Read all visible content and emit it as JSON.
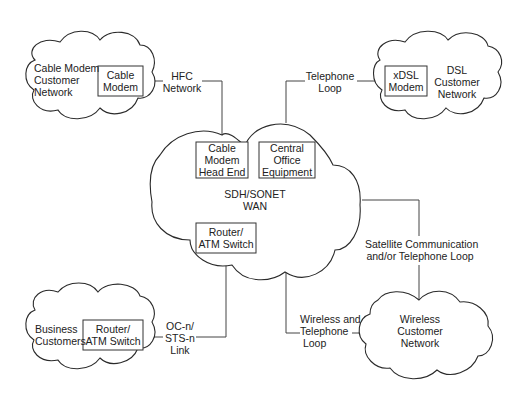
{
  "diagram": {
    "colors": {
      "stroke": "#2a2a2a",
      "text": "#222222",
      "background": "#ffffff"
    },
    "clouds": {
      "cable_modem_network": {
        "label": "Cable Modem\nCustomer\nNetwork",
        "device": "Cable\nModem"
      },
      "dsl_network": {
        "label": "DSL\nCustomer\nNetwork",
        "device": "xDSL\nModem"
      },
      "wan": {
        "label": "SDH/SONET\nWAN",
        "devices": {
          "head_end": "Cable\nModem\nHead End",
          "central_office": "Central\nOffice\nEquipment",
          "router": "Router/\nATM Switch"
        }
      },
      "business": {
        "label": "Business\nCustomers",
        "device": "Router/\nATM Switch"
      },
      "wireless": {
        "label": "Wireless\nCustomer\nNetwork"
      }
    },
    "links": {
      "hfc": "HFC\nNetwork",
      "telephone": "Telephone\nLoop",
      "satellite": "Satellite Communication\nand/or Telephone Loop",
      "wireless": "Wireless and\nTelephone\n Loop",
      "ocn": "OC-n/\nSTS-n\nLink"
    }
  }
}
